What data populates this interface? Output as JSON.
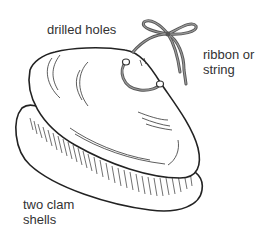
{
  "figure": {
    "labels": {
      "drilled_holes": "drilled holes",
      "ribbon_line1": "ribbon or",
      "ribbon_line2": "string",
      "clam_line1": "two clam",
      "clam_line2": "shells"
    },
    "colors": {
      "outline": "#222222",
      "ribbon": "#555555",
      "ribbon_fill": "#8a8a8a",
      "text": "#333333",
      "background": "#ffffff"
    }
  }
}
